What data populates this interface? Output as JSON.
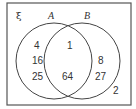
{
  "diagram": {
    "type": "venn",
    "universal_symbol": "ξ",
    "sets": [
      {
        "label": "A",
        "only": [
          "4",
          "16",
          "25"
        ]
      },
      {
        "label": "B",
        "only": [
          "8",
          "27"
        ]
      }
    ],
    "intersection": [
      "1",
      "64"
    ],
    "outside": [
      "2"
    ]
  }
}
